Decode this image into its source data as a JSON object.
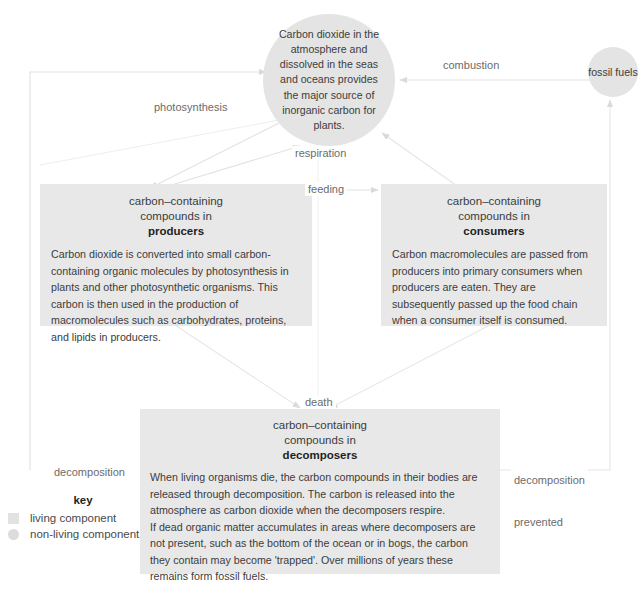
{
  "diagram": {
    "colors": {
      "box_fill": "#e8e8e8",
      "circle_fill": "#e4e4e4",
      "arrow": "#dcdcdc",
      "text": "#3c3c3c",
      "label_text": "#6b6b6b"
    }
  },
  "nodes": {
    "atmosphere": {
      "name": "atmosphere-circle",
      "type": "non-living",
      "text": "Carbon dioxide in the atmosphere and dissolved in the seas and oceans provides the major source of inorganic carbon for plants."
    },
    "fossil_fuels": {
      "name": "fossil-fuels-circle",
      "type": "non-living",
      "text": "fossil fuels"
    },
    "producers": {
      "name": "producers-box",
      "type": "living",
      "heading_line1": "carbon–containing",
      "heading_line2": "compounds in",
      "heading_strong": "producers",
      "body": "Carbon dioxide is converted into small carbon-containing organic molecules by photosynthesis in plants and other photosynthetic organisms. This carbon is then used in the production of macromolecules such as carbohydrates, proteins, and lipids in producers."
    },
    "consumers": {
      "name": "consumers-box",
      "type": "living",
      "heading_line1": "carbon–containing",
      "heading_line2": "compounds in",
      "heading_strong": "consumers",
      "body": "Carbon macromolecules are passed from producers into primary consumers when producers are eaten. They are subsequently passed up the food chain when a consumer itself is consumed."
    },
    "decomposers": {
      "name": "decomposers-box",
      "type": "living",
      "heading_line1": "carbon–containing",
      "heading_line2": "compounds in",
      "heading_strong": "decomposers",
      "body_para1": "When living organisms die, the carbon compounds in their bodies are released through decomposition. The carbon is released into the atmosphere as carbon dioxide when the decomposers respire.",
      "body_para2": "If dead organic matter accumulates in areas where decomposers are not present, such as the bottom of the ocean or in bogs, the carbon they contain may become 'trapped'. Over millions of years these remains form fossil fuels."
    }
  },
  "edges": {
    "photosynthesis": "photosynthesis",
    "respiration": "respiration",
    "combustion": "combustion",
    "feeding": "feeding",
    "death": "death",
    "decomposition": "decomposition",
    "decomposition_prevented_line1": "decomposition",
    "decomposition_prevented_line2": "prevented"
  },
  "key": {
    "title": "key",
    "items": [
      {
        "swatch": "square",
        "label": "living component"
      },
      {
        "swatch": "circle",
        "label": "non-living component"
      }
    ]
  },
  "caption": ""
}
